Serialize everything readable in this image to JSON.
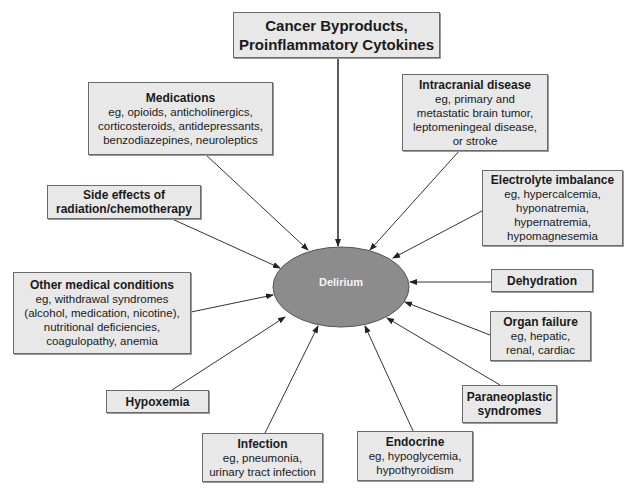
{
  "center": {
    "label": "Delirium",
    "fill": "#8c8c8c"
  },
  "top": {
    "title_line1": "Cancer Byproducts,",
    "title_line2": "Proinflammatory Cytokines"
  },
  "causes": {
    "medications": {
      "title": "Medications",
      "lines": [
        "eg, opioids, anticholinergics,",
        "corticosteroids, antidepressants,",
        "benzodiazepines, neuroleptics"
      ]
    },
    "intracranial": {
      "title": "Intracranial disease",
      "lines": [
        "eg, primary and",
        "metastatic brain tumor,",
        "leptomeningeal disease,",
        "or stroke"
      ]
    },
    "electrolyte": {
      "title": "Electrolyte imbalance",
      "lines": [
        "eg, hypercalcemia,",
        "hyponatremia,",
        "hypernatremia,",
        "hypomagnesemia"
      ]
    },
    "side_effects": {
      "title_line1": "Side effects of",
      "title_line2": "radiation/chemotherapy"
    },
    "other_medical": {
      "title": "Other medical conditions",
      "lines": [
        "eg, withdrawal syndromes",
        "(alcohol, medication, nicotine),",
        "nutritional deficiencies,",
        "coagulopathy, anemia"
      ]
    },
    "dehydration": {
      "title": "Dehydration"
    },
    "organ_failure": {
      "title": "Organ failure",
      "lines": [
        "eg, hepatic,",
        "renal, cardiac"
      ]
    },
    "hypoxemia": {
      "title": "Hypoxemia"
    },
    "paraneoplastic": {
      "title_line1": "Paraneoplastic",
      "title_line2": "syndromes"
    },
    "infection": {
      "title": "Infection",
      "lines": [
        "eg, pneumonia,",
        "urinary tract infection"
      ]
    },
    "endocrine": {
      "title": "Endocrine",
      "lines": [
        "eg, hypoglycemia,",
        "hypothyroidism"
      ]
    }
  },
  "colors": {
    "box_fill": "#e8e8e8",
    "box_border": "#6a6a6a",
    "arrow": "#333333",
    "ellipse_fill": "#8c8c8c"
  }
}
